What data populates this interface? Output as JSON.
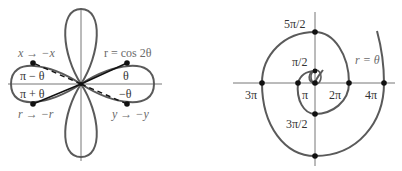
{
  "colors": {
    "curve": "#5a5a5a",
    "axis": "#777777",
    "dot": "#111111",
    "text": "#333333",
    "text_muted": "#6a6a6a"
  },
  "left_figure": {
    "curve_label": "r = cos 2θ",
    "angle_labels": {
      "q1": "θ",
      "q4": "−θ",
      "q2": "π − θ",
      "q3": "π + θ"
    },
    "symmetry_labels": {
      "top_left": "x → −x",
      "bottom_left": "r → −r",
      "bottom_right": "y → −y"
    }
  },
  "right_figure": {
    "curve_label": "r = θ",
    "tick_labels": {
      "five_pi_over_2": "5π/2",
      "pi_over_2": "π/2",
      "three_pi": "3π",
      "pi": "π",
      "two_pi": "2π",
      "four_pi": "4π",
      "three_pi_over_2": "3π/2"
    }
  }
}
